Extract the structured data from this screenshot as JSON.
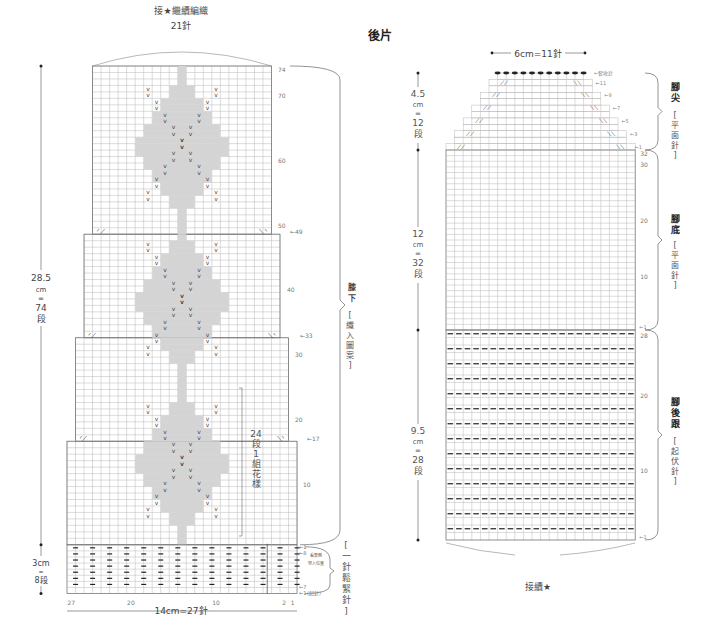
{
  "page_title": "後片",
  "left_chart": {
    "top_label_line1": "接★繼續編織",
    "top_label_line2": "21針",
    "height_label": [
      "28.5",
      "cm",
      "=",
      "74",
      "段"
    ],
    "ribbing_height_label": [
      "3cm",
      "=",
      "8段"
    ],
    "bottom_width_label": "14cm=27針",
    "bottom_ticks": [
      "27",
      "20",
      "10",
      "2",
      "1"
    ],
    "row_numbers": [
      "74",
      "70",
      "60",
      "50",
      "40",
      "30",
      "20",
      "10"
    ],
    "decrease_markers": [
      "←49",
      "←33",
      "←17"
    ],
    "ribbing_markers": [
      "←1",
      "←8",
      "←7",
      "←1"
    ],
    "ribbing_note": "看緊側穿入位置",
    "cast_on_note": "(起針)",
    "repeat_label": [
      "24",
      "段",
      "1",
      "組",
      "花",
      "樣"
    ],
    "section_main": {
      "name": "膝下",
      "stitch": "[織入圖案]"
    },
    "section_ribbing": {
      "name": "",
      "stitch": "[一針鬆緊針]"
    },
    "stitches_total": 27,
    "rows_main": 74,
    "rows_ribbing": 8,
    "widths_by_row": [
      {
        "from_row": 1,
        "to_row": 16,
        "stitches": 27
      },
      {
        "from_row": 17,
        "to_row": 32,
        "stitches": 25
      },
      {
        "from_row": 33,
        "to_row": 48,
        "stitches": 23
      },
      {
        "from_row": 49,
        "to_row": 74,
        "stitches": 21
      }
    ]
  },
  "right_chart": {
    "top_width_label": "6cm=11針",
    "bind_off_label": "←套收針",
    "toe_height_label": [
      "4.5",
      "cm",
      "=",
      "12",
      "段"
    ],
    "sole_height_label": [
      "12",
      "cm",
      "=",
      "32",
      "段"
    ],
    "heel_height_label": [
      "9.5",
      "cm",
      "=",
      "28",
      "段"
    ],
    "bottom_label": "接續★",
    "toe_markers": [
      "←11",
      "←9",
      "←7",
      "←5",
      "←3",
      "←1"
    ],
    "sole_row_numbers": [
      "32",
      "30",
      "20",
      "10"
    ],
    "sole_markers": [
      "←1"
    ],
    "heel_row_numbers": [
      "28",
      "20",
      "10"
    ],
    "heel_markers": [
      "←1"
    ],
    "section_toe": {
      "name": "腳尖",
      "stitch": "[平面針]"
    },
    "section_sole": {
      "name": "腳底",
      "stitch": "[平面針]"
    },
    "section_heel": {
      "name": "腳後跟",
      "stitch": "[起伏針]"
    },
    "stitches_bottom": 22,
    "stitches_top": 11,
    "rows_toe": 12,
    "rows_sole": 32,
    "rows_heel": 28
  },
  "colors": {
    "grid": "#b8b8b8",
    "outline": "#777777",
    "motif_fill": "#d4d4d4",
    "motif_outline": "#888888",
    "text": "#444444"
  }
}
